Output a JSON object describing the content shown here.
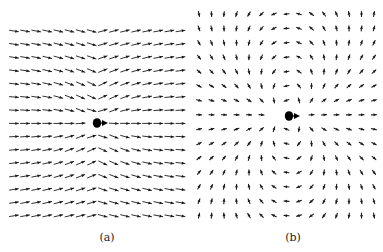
{
  "figure": {
    "background": "#ffffff",
    "arrow_color": "#1a1a1a",
    "panels": [
      {
        "id": "a",
        "caption": "(a)",
        "caption_x": 107,
        "description": "Vector field of uniform flow past a moving particle (flow to the right, arrows converge toward the centre line)",
        "grid": {
          "cols": 16,
          "rows": 15,
          "x0": 14,
          "dx": 11.1,
          "y0": 31,
          "dy": 13.2
        },
        "field": {
          "type": "uniform_plus_dipole",
          "uniform": 1.0,
          "strength": -0.55,
          "scale": 34
        },
        "arrow_length": 9,
        "excluded_rect": {
          "x": 86,
          "y": 112,
          "w": 23,
          "h": 22
        },
        "particle": {
          "cx": 97,
          "cy": 123,
          "r": 4.2,
          "arrow_to_x": 108
        }
      },
      {
        "id": "b",
        "caption": "(b)",
        "caption_x": 293,
        "description": "Vector field of dipole flow around a moving particle (disturbance flow in co-moving frame)",
        "grid": {
          "cols": 15,
          "rows": 15,
          "x0": 199,
          "dx": 12.5,
          "y0": 14,
          "dy": 14.4
        },
        "field": {
          "type": "dipole",
          "uniform": 0.0,
          "strength": 1.0,
          "scale": 40
        },
        "arrow_length": 5,
        "excluded_rect": {
          "x": 265,
          "y": 103,
          "w": 42,
          "h": 26
        },
        "particle": {
          "cx": 289,
          "cy": 116,
          "r": 4.2,
          "arrow_to_x": 300
        }
      }
    ]
  }
}
